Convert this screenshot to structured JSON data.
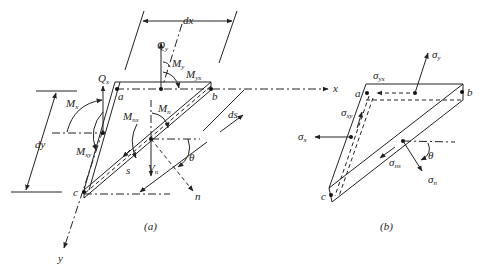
{
  "figure": {
    "panel_a": {
      "caption": "(a)",
      "labels": {
        "dx": "dx",
        "dy": "dy",
        "ds": "ds",
        "Qy": "Q",
        "Qy_sub": "y",
        "Qx": "Q",
        "Qx_sub": "x",
        "My": "M",
        "My_sub": "y",
        "Myx": "M",
        "Myx_sub": "yx",
        "Mx": "M",
        "Mx_sub": "x",
        "Mxy": "M",
        "Mxy_sub": "xy",
        "Mn": "M",
        "Mn_sub": "n",
        "Mns": "M",
        "Mns_sub": "ns",
        "Vn": "V",
        "Vn_sub": "n",
        "a": "a",
        "b": "b",
        "c": "c",
        "s": "s",
        "n": "n",
        "theta": "θ",
        "x_axis": "x",
        "y_axis": "y"
      }
    },
    "panel_b": {
      "caption": "(b)",
      "labels": {
        "sigma_y": "σ",
        "sigma_y_sub": "y",
        "sigma_yx": "σ",
        "sigma_yx_sub": "yx",
        "sigma_xy": "σ",
        "sigma_xy_sub": "xy",
        "sigma_x": "σ",
        "sigma_x_sub": "x",
        "sigma_ns": "σ",
        "sigma_ns_sub": "ns",
        "sigma_n": "σ",
        "sigma_n_sub": "n",
        "a": "a",
        "b": "b",
        "c": "c",
        "theta": "θ"
      }
    }
  }
}
